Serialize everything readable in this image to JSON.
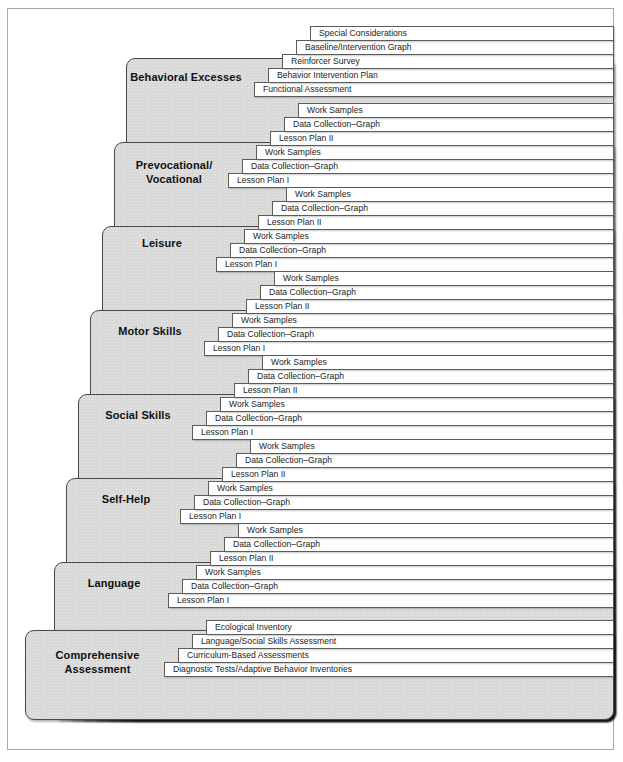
{
  "figure": {
    "caption": "",
    "colors": {
      "block_fill": "#d9d9d9",
      "block_stroke": "#4a4a4a",
      "tab_fill": "#ffffff",
      "tab_stroke": "#5c5c5c",
      "frame_stroke": "#a8a8a8",
      "text": "#111111",
      "page_background": "#ffffff"
    }
  },
  "groups": [
    {
      "id": "behavioral-excesses",
      "label": "Behavioral Excesses",
      "label_lines": "Behavioral Excesses",
      "block": {
        "left": 125,
        "top": 57,
        "width": 488,
        "height": 662
      },
      "label_top": 70,
      "label_left": 125,
      "label_width": 120,
      "tabs": [
        {
          "label": "Special Considerations",
          "left": 309,
          "top": 25
        },
        {
          "label": "Baseline/Intervention Graph",
          "left": 295,
          "top": 39
        },
        {
          "label": "Reinforcer Survey",
          "left": 281,
          "top": 53
        },
        {
          "label": "Behavior Intervention Plan",
          "left": 267,
          "top": 67
        },
        {
          "label": "Functional Assessment",
          "left": 253,
          "top": 81
        }
      ]
    },
    {
      "id": "prevocational-vocational",
      "label": "Prevocational/ Vocational",
      "label_lines": "Prevocational/\nVocational",
      "block": {
        "left": 113,
        "top": 141,
        "width": 500,
        "height": 578
      },
      "label_top": 158,
      "label_left": 113,
      "label_width": 120,
      "tabs": [
        {
          "label": "Work Samples",
          "left": 297,
          "top": 102
        },
        {
          "label": "Data Collection–Graph",
          "left": 283,
          "top": 116
        },
        {
          "label": "Lesson Plan II",
          "left": 269,
          "top": 130
        },
        {
          "label": "Work Samples",
          "left": 255,
          "top": 144
        },
        {
          "label": "Data Collection–Graph",
          "left": 241,
          "top": 158
        },
        {
          "label": "Lesson Plan I",
          "left": 227,
          "top": 172
        }
      ]
    },
    {
      "id": "leisure",
      "label": "Leisure",
      "label_lines": "Leisure",
      "block": {
        "left": 101,
        "top": 225,
        "width": 512,
        "height": 494
      },
      "label_top": 236,
      "label_left": 101,
      "label_width": 120,
      "tabs": [
        {
          "label": "Work Samples",
          "left": 285,
          "top": 186
        },
        {
          "label": "Data Collection–Graph",
          "left": 271,
          "top": 200
        },
        {
          "label": "Lesson Plan II",
          "left": 257,
          "top": 214
        },
        {
          "label": "Work Samples",
          "left": 243,
          "top": 228
        },
        {
          "label": "Data Collection–Graph",
          "left": 229,
          "top": 242
        },
        {
          "label": "Lesson Plan I",
          "left": 215,
          "top": 256
        }
      ]
    },
    {
      "id": "motor-skills",
      "label": "Motor Skills",
      "label_lines": "Motor Skills",
      "block": {
        "left": 89,
        "top": 309,
        "width": 524,
        "height": 410
      },
      "label_top": 324,
      "label_left": 89,
      "label_width": 120,
      "tabs": [
        {
          "label": "Work Samples",
          "left": 273,
          "top": 270
        },
        {
          "label": "Data Collection–Graph",
          "left": 259,
          "top": 284
        },
        {
          "label": "Lesson Plan II",
          "left": 245,
          "top": 298
        },
        {
          "label": "Work Samples",
          "left": 231,
          "top": 312
        },
        {
          "label": "Data Collection–Graph",
          "left": 217,
          "top": 326
        },
        {
          "label": "Lesson Plan I",
          "left": 203,
          "top": 340
        }
      ]
    },
    {
      "id": "social-skills",
      "label": "Social Skills",
      "label_lines": "Social Skills",
      "block": {
        "left": 77,
        "top": 393,
        "width": 536,
        "height": 326
      },
      "label_top": 408,
      "label_left": 77,
      "label_width": 120,
      "tabs": [
        {
          "label": "Work Samples",
          "left": 261,
          "top": 354
        },
        {
          "label": "Data Collection–Graph",
          "left": 247,
          "top": 368
        },
        {
          "label": "Lesson Plan II",
          "left": 233,
          "top": 382
        },
        {
          "label": "Work Samples",
          "left": 219,
          "top": 396
        },
        {
          "label": "Data Collection–Graph",
          "left": 205,
          "top": 410
        },
        {
          "label": "Lesson Plan I",
          "left": 191,
          "top": 424
        }
      ]
    },
    {
      "id": "self-help",
      "label": "Self-Help",
      "label_lines": "Self-Help",
      "block": {
        "left": 65,
        "top": 477,
        "width": 548,
        "height": 242
      },
      "label_top": 492,
      "label_left": 65,
      "label_width": 120,
      "tabs": [
        {
          "label": "Work Samples",
          "left": 249,
          "top": 438
        },
        {
          "label": "Data Collection–Graph",
          "left": 235,
          "top": 452
        },
        {
          "label": "Lesson Plan II",
          "left": 221,
          "top": 466
        },
        {
          "label": "Work Samples",
          "left": 207,
          "top": 480
        },
        {
          "label": "Data Collection–Graph",
          "left": 193,
          "top": 494
        },
        {
          "label": "Lesson Plan I",
          "left": 179,
          "top": 508
        }
      ]
    },
    {
      "id": "language",
      "label": "Language",
      "label_lines": "Language",
      "block": {
        "left": 53,
        "top": 561,
        "width": 560,
        "height": 158
      },
      "label_top": 576,
      "label_left": 53,
      "label_width": 120,
      "tabs": [
        {
          "label": "Work Samples",
          "left": 237,
          "top": 522
        },
        {
          "label": "Data Collection–Graph",
          "left": 223,
          "top": 536
        },
        {
          "label": "Lesson Plan II",
          "left": 209,
          "top": 550
        },
        {
          "label": "Work Samples",
          "left": 195,
          "top": 564
        },
        {
          "label": "Data Collection–Graph",
          "left": 181,
          "top": 578
        },
        {
          "label": "Lesson Plan I",
          "left": 167,
          "top": 592
        }
      ]
    },
    {
      "id": "comprehensive-assessment",
      "label": "Comprehensive Assessment",
      "label_lines": "Comprehensive\nAssessment",
      "block": {
        "left": 24,
        "top": 629,
        "width": 589,
        "height": 90
      },
      "label_top": 648,
      "label_left": 24,
      "label_width": 145,
      "tabs": [
        {
          "label": "Ecological Inventory",
          "left": 205,
          "top": 619
        },
        {
          "label": "Language/Social Skills Assessment",
          "left": 191,
          "top": 633
        },
        {
          "label": "Curriculum-Based Assessments",
          "left": 177,
          "top": 647
        },
        {
          "label": "Diagnostic Tests/Adaptive Behavior Inventories",
          "left": 163,
          "top": 661
        }
      ]
    }
  ],
  "tab_geometry": {
    "right_edge": 613,
    "height": 15,
    "row_step": 14
  }
}
